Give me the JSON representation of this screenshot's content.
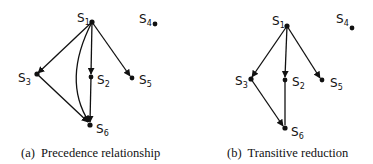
{
  "figures": [
    {
      "id": "a",
      "caption": "(a)  Precedence relationship",
      "nodes": [
        {
          "id": "S1",
          "letter": "S",
          "sub": "1"
        },
        {
          "id": "S2",
          "letter": "S",
          "sub": "2"
        },
        {
          "id": "S3",
          "letter": "S",
          "sub": "3"
        },
        {
          "id": "S4",
          "letter": "S",
          "sub": "4"
        },
        {
          "id": "S5",
          "letter": "S",
          "sub": "5"
        },
        {
          "id": "S6",
          "letter": "S",
          "sub": "6"
        }
      ],
      "edges": [
        {
          "from": "S1",
          "to": "S3"
        },
        {
          "from": "S1",
          "to": "S2"
        },
        {
          "from": "S1",
          "to": "S5"
        },
        {
          "from": "S1",
          "to": "S6",
          "curved": true
        },
        {
          "from": "S3",
          "to": "S6"
        },
        {
          "from": "S2",
          "to": "S6"
        }
      ]
    },
    {
      "id": "b",
      "caption": "(b)  Transitive reduction",
      "nodes": [
        {
          "id": "S1",
          "letter": "S",
          "sub": "1"
        },
        {
          "id": "S2",
          "letter": "S",
          "sub": "2"
        },
        {
          "id": "S3",
          "letter": "S",
          "sub": "3"
        },
        {
          "id": "S4",
          "letter": "S",
          "sub": "4"
        },
        {
          "id": "S5",
          "letter": "S",
          "sub": "5"
        },
        {
          "id": "S6",
          "letter": "S",
          "sub": "6"
        }
      ],
      "edges": [
        {
          "from": "S1",
          "to": "S3"
        },
        {
          "from": "S1",
          "to": "S2"
        },
        {
          "from": "S1",
          "to": "S5"
        },
        {
          "from": "S3",
          "to": "S6"
        },
        {
          "from": "S2",
          "to": "S6"
        }
      ]
    }
  ]
}
